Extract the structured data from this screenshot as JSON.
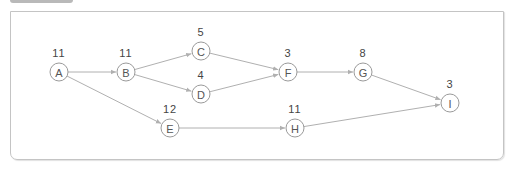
{
  "diagram": {
    "type": "activity-network",
    "nodes": [
      {
        "id": "A",
        "label": "A",
        "duration": "11",
        "x": 59,
        "y": 72
      },
      {
        "id": "B",
        "label": "B",
        "duration": "11",
        "x": 126,
        "y": 72
      },
      {
        "id": "C",
        "label": "C",
        "duration": "5",
        "x": 201,
        "y": 51
      },
      {
        "id": "D",
        "label": "D",
        "duration": "4",
        "x": 201,
        "y": 94
      },
      {
        "id": "E",
        "label": "E",
        "duration": "12",
        "x": 170,
        "y": 128
      },
      {
        "id": "F",
        "label": "F",
        "duration": "3",
        "x": 288,
        "y": 72
      },
      {
        "id": "G",
        "label": "G",
        "duration": "8",
        "x": 363,
        "y": 72
      },
      {
        "id": "H",
        "label": "H",
        "duration": "11",
        "x": 295,
        "y": 128
      },
      {
        "id": "I",
        "label": "I",
        "duration": "3",
        "x": 450,
        "y": 103
      }
    ],
    "edges": [
      {
        "from": "A",
        "to": "B"
      },
      {
        "from": "A",
        "to": "E"
      },
      {
        "from": "B",
        "to": "C"
      },
      {
        "from": "B",
        "to": "D"
      },
      {
        "from": "C",
        "to": "F"
      },
      {
        "from": "D",
        "to": "F"
      },
      {
        "from": "F",
        "to": "G"
      },
      {
        "from": "G",
        "to": "I"
      },
      {
        "from": "E",
        "to": "H"
      },
      {
        "from": "H",
        "to": "I"
      }
    ],
    "colors": {
      "edge": "#b0b0b0",
      "node_stroke": "#9a9a9a",
      "text": "#444444",
      "frame": "#c4c4c4"
    }
  }
}
